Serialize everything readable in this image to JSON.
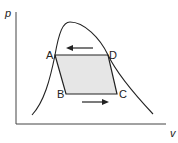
{
  "diagram": {
    "type": "p-v cycle diagram",
    "axes": {
      "y_label": "p",
      "x_label": "v"
    },
    "points": [
      {
        "id": "A",
        "label": "A"
      },
      {
        "id": "B",
        "label": "B"
      },
      {
        "id": "C",
        "label": "C"
      },
      {
        "id": "D",
        "label": "D"
      }
    ],
    "cycle_order": [
      "A",
      "B",
      "C",
      "D"
    ],
    "arrows": [
      {
        "name": "top-arrow",
        "direction": "left"
      },
      {
        "name": "bottom-arrow",
        "direction": "right"
      }
    ],
    "colors": {
      "line": "#222222",
      "cycle_fill": "#e6e6e6",
      "background": "#ffffff"
    }
  }
}
